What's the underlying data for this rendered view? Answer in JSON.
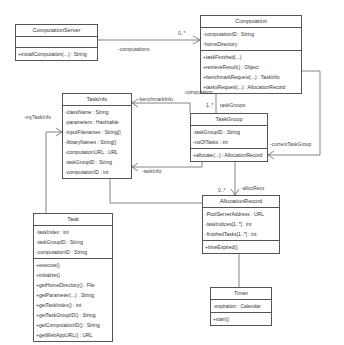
{
  "classes": {
    "computation_server": {
      "name": "ComputationServer",
      "attributes": [],
      "methods": [
        "+installComputation(...) : String"
      ]
    },
    "computation": {
      "name": "Computation",
      "attributes": [
        "-computationID : String",
        "-homeDirectory"
      ],
      "methods": [
        "+taskFinished(...)",
        "+retrieveResult() : Object",
        "+benchmarkRequest(...) : TaskInfo",
        "+tasksRequest(...) : AllocationRecord"
      ]
    },
    "task_info": {
      "name": "TaskInfo",
      "attributes": [
        "-className : String",
        "-parameters : Hashtable",
        "-inputFilenames : String[]",
        "-libraryNames : String[]",
        "-computationURL : URL",
        "-taskGroupID : String",
        "-computationID : int"
      ],
      "methods": []
    },
    "task_group": {
      "name": "TaskGroup",
      "attributes": [
        "-taskGroupID : String",
        "-noOfTasks : int"
      ],
      "methods": [
        "+allocate(...) : AllocationRecord"
      ]
    },
    "allocation_record": {
      "name": "AllocationRecord",
      "attributes": [
        "-PoolServerAddress : URL",
        "-taskIndices[1..*] : int",
        "-finishedTasks[1..*] : int"
      ],
      "methods": [
        "+timeExpired()"
      ]
    },
    "task": {
      "name": "Task",
      "attributes": [
        "-taskIndex : int",
        "-taskGroupID : String",
        "-computationID : String"
      ],
      "methods": [
        "+execute()",
        "+initialize()",
        "+getHomeDirectory() : File",
        "+getParameter(...) : String",
        "+getTaskIndex() : int",
        "+getTaskGroupID() : String",
        "+getComputationID() : String",
        "+getWebAppURL() : URL"
      ]
    },
    "timer": {
      "name": "Timer",
      "attributes": [
        "-expiration : Calendar"
      ],
      "methods": [
        "+start()"
      ]
    }
  },
  "associations": {
    "computations": {
      "role": "-computations",
      "multiplicity": "0..*"
    },
    "computation": {
      "role": "-computation"
    },
    "task_groups": {
      "role": "taskGroups",
      "multiplicity": "1..*"
    },
    "benchmark_info": {
      "role": "-benchmarkInfo"
    },
    "task_info": {
      "role": "-taskInfo"
    },
    "my_task_info": {
      "role": "-myTaskInfo"
    },
    "current_task_group": {
      "role": "-currentTaskGroup"
    },
    "alloc_recs": {
      "role": "-allocRecs",
      "multiplicity": "0..*"
    }
  },
  "colors": {
    "line": "#555555",
    "text": "#333333",
    "background": "#ffffff"
  }
}
